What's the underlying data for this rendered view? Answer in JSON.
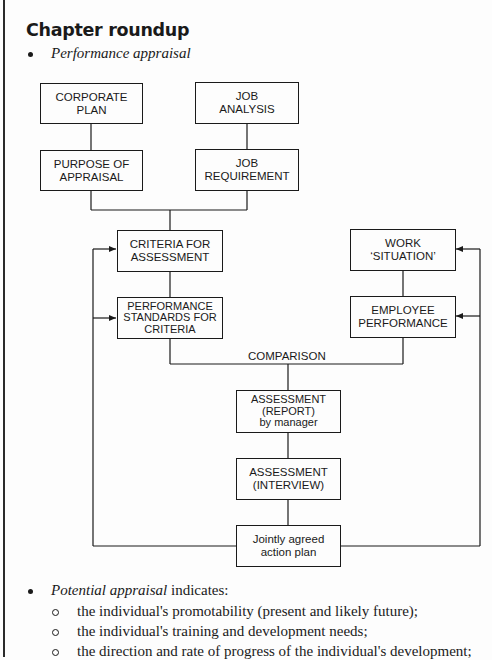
{
  "heading": "Chapter roundup",
  "bullets": {
    "performance_appraisal": "Performance appraisal",
    "potential_appraisal_italic": "Potential appraisal",
    "potential_appraisal_rest": " indicates:"
  },
  "sub_bullets": [
    "the individual's promotability (present and likely future);",
    "the individual's training and development needs;",
    "the direction and rate of progress of the individual's development;"
  ],
  "diagram": {
    "boxes": {
      "corporate_plan": "CORPORATE\nPLAN",
      "job_analysis": "JOB\nANALYSIS",
      "purpose_of_appraisal": "PURPOSE OF\nAPPRAISAL",
      "job_requirement": "JOB\nREQUIREMENT",
      "criteria_for_assessment": "CRITERIA FOR\nASSESSMENT",
      "performance_standards": "PERFORMANCE\nSTANDARDS FOR\nCRITERIA",
      "work_situation": "WORK\n‘SITUATION’",
      "employee_performance": "EMPLOYEE\nPERFORMANCE",
      "assessment_report": "ASSESSMENT\n(REPORT)\nby manager",
      "assessment_interview": "ASSESSMENT\n(INTERVIEW)",
      "jointly_agreed": "Jointly agreed\naction plan"
    },
    "comparison_label": "COMPARISON"
  }
}
